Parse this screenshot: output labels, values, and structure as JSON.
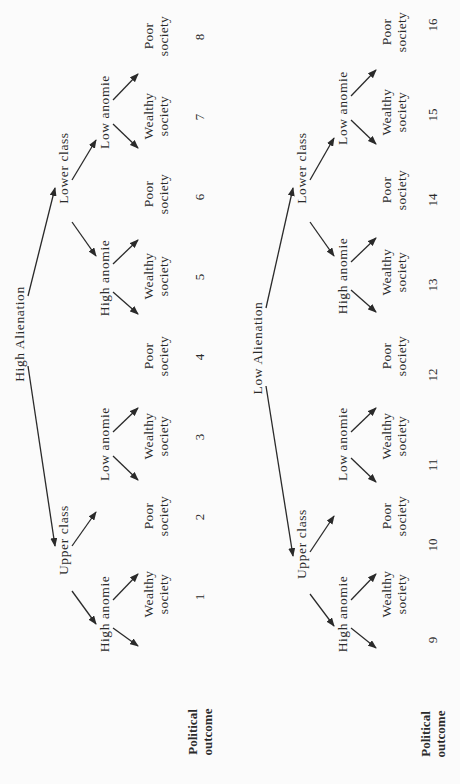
{
  "diagram": {
    "type": "tree",
    "orientation": "rotated-90-ccw",
    "background": "#fbfbfb",
    "ink": "#2a2a2a",
    "trees": [
      {
        "root": "High Alienation",
        "outcome_label": [
          "Political",
          "outcome"
        ],
        "branches": [
          {
            "label": "Upper class",
            "children": [
              {
                "label": "High anomie",
                "leaves": [
                  {
                    "line1": "Wealthy",
                    "line2": "society",
                    "outcome": "1"
                  },
                  {
                    "line1": "Poor",
                    "line2": "society",
                    "outcome": "2"
                  }
                ]
              },
              {
                "label": "Low anomie",
                "leaves": [
                  {
                    "line1": "Wealthy",
                    "line2": "society",
                    "outcome": "3"
                  },
                  {
                    "line1": "Poor",
                    "line2": "society",
                    "outcome": "4"
                  }
                ]
              }
            ]
          },
          {
            "label": "Lower class",
            "children": [
              {
                "label": "High anomie",
                "leaves": [
                  {
                    "line1": "Wealthy",
                    "line2": "society",
                    "outcome": "5"
                  },
                  {
                    "line1": "Poor",
                    "line2": "society",
                    "outcome": "6"
                  }
                ]
              },
              {
                "label": "Low anomie",
                "leaves": [
                  {
                    "line1": "Wealthy",
                    "line2": "society",
                    "outcome": "7"
                  },
                  {
                    "line1": "Poor",
                    "line2": "society",
                    "outcome": "8"
                  }
                ]
              }
            ]
          }
        ]
      },
      {
        "root": "Low Alienation",
        "outcome_label": [
          "Political",
          "outcome"
        ],
        "branches": [
          {
            "label": "Upper class",
            "children": [
              {
                "label": "High anomie",
                "leaves": [
                  {
                    "line1": "Wealthy",
                    "line2": "society",
                    "outcome": "9"
                  },
                  {
                    "line1": "Poor",
                    "line2": "society",
                    "outcome": "10"
                  }
                ]
              },
              {
                "label": "Low anomie",
                "leaves": [
                  {
                    "line1": "Wealthy",
                    "line2": "society",
                    "outcome": "11"
                  },
                  {
                    "line1": "Poor",
                    "line2": "society",
                    "outcome": "12"
                  }
                ]
              }
            ]
          },
          {
            "label": "Lower class",
            "children": [
              {
                "label": "High anomie",
                "leaves": [
                  {
                    "line1": "Wealthy",
                    "line2": "society",
                    "outcome": "13"
                  },
                  {
                    "line1": "Poor",
                    "line2": "society",
                    "outcome": "14"
                  }
                ]
              },
              {
                "label": "Low anomie",
                "leaves": [
                  {
                    "line1": "Wealthy",
                    "line2": "society",
                    "outcome": "15"
                  },
                  {
                    "line1": "Poor",
                    "line2": "society",
                    "outcome": "16"
                  }
                ]
              }
            ]
          }
        ]
      }
    ]
  }
}
